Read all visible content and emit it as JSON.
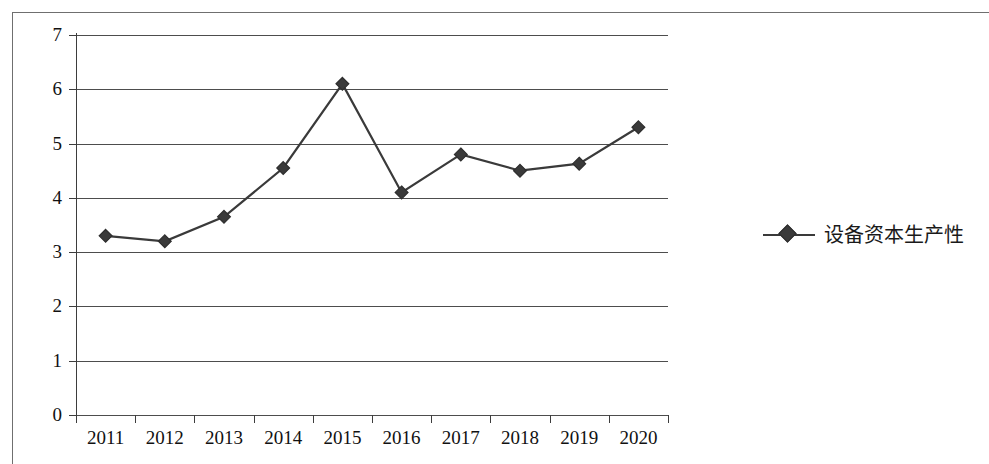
{
  "chart_data": {
    "type": "line",
    "title": "",
    "xlabel": "",
    "ylabel": "",
    "categories": [
      "2011",
      "2012",
      "2013",
      "2014",
      "2015",
      "2016",
      "2017",
      "2018",
      "2019",
      "2020"
    ],
    "series": [
      {
        "name": "设备资本生产性",
        "marker": "diamond",
        "color": "#3a3a3a",
        "values": [
          3.3,
          3.2,
          3.65,
          4.55,
          6.1,
          4.1,
          4.8,
          4.5,
          4.63,
          5.3
        ]
      }
    ],
    "ylim": [
      0,
      7
    ],
    "y_ticks": [
      "0",
      "1",
      "2",
      "3",
      "4",
      "5",
      "6",
      "7"
    ],
    "grid": "horizontal",
    "legend_position": "right"
  },
  "legend": {
    "entries": [
      {
        "label": "设备资本生产性",
        "marker_name": "diamond-marker"
      }
    ]
  },
  "axes": {
    "y_axis_name": "value-axis",
    "x_axis_name": "category-axis"
  }
}
